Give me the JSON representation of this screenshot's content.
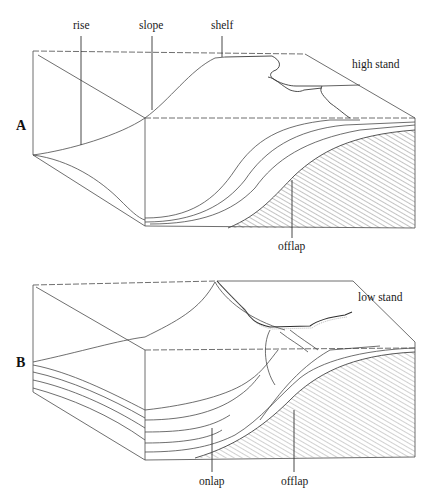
{
  "figure": {
    "type": "block diagram of continental margin sediment geometry",
    "panels": [
      {
        "id": "A",
        "letter": "A",
        "sea_level_label": "high stand",
        "labels": {
          "rise": "rise",
          "slope": "slope",
          "shelf": "shelf",
          "offlap": "offlap"
        }
      },
      {
        "id": "B",
        "letter": "B",
        "sea_level_label": "low stand",
        "labels": {
          "onlap": "onlap",
          "offlap": "offlap"
        }
      }
    ],
    "colors": {
      "line": "#3a3a3a",
      "hatch": "#8a8a8a",
      "background": "#ffffff"
    }
  }
}
